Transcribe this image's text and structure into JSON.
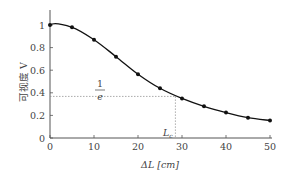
{
  "chart_data": {
    "type": "line",
    "title": "",
    "xlabel": "ΔL [cm]",
    "ylabel": "可视度 V",
    "x": [
      0,
      5,
      10,
      15,
      20,
      25,
      30,
      35,
      40,
      45,
      50
    ],
    "series": [
      {
        "name": "V",
        "values": [
          1.0,
          0.98,
          0.87,
          0.72,
          0.565,
          0.44,
          0.35,
          0.28,
          0.225,
          0.18,
          0.155
        ]
      }
    ],
    "xlim": [
      0,
      50
    ],
    "ylim": [
      0,
      1.1
    ],
    "xticks": [
      0,
      10,
      20,
      30,
      40,
      50
    ],
    "yticks": [
      0,
      0.2,
      0.4,
      0.6,
      0.8,
      1
    ],
    "ytick_labels": [
      "0",
      "0.2",
      "0.4",
      "0.6",
      "0.8",
      "1"
    ],
    "grid": false,
    "legend": null,
    "annotations": [
      {
        "text_num": "1",
        "text_den": "e",
        "y": 0.368,
        "style": "dotted horizontal line"
      },
      {
        "text": "Lc",
        "x": 28.5,
        "style": "dotted vertical line"
      }
    ]
  },
  "labels": {
    "x_axis": "ΔL [cm]",
    "y_axis": "可视度 V",
    "inv_e_num": "1",
    "inv_e_den": "e",
    "coherence_length_main": "L",
    "coherence_length_sub": "c"
  }
}
